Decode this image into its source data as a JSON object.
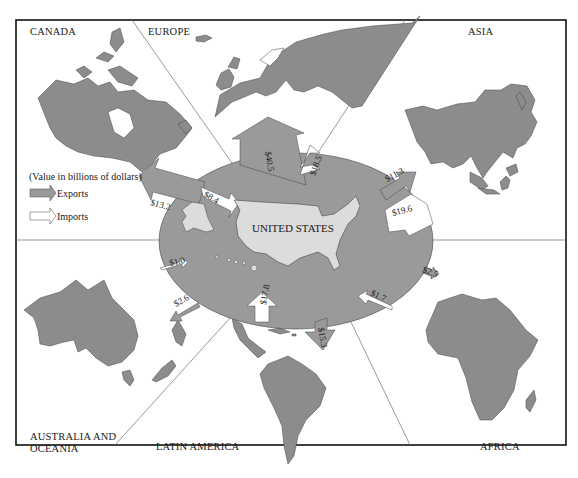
{
  "diagram": {
    "type": "trade-flow-map",
    "center_label": "UNITED STATES",
    "legend": {
      "note": "(Value in billions of dollars)",
      "exports_label": "Exports",
      "imports_label": "Imports"
    },
    "regions": [
      {
        "name": "CANADA",
        "exports": "$13.2",
        "imports": "$8.4"
      },
      {
        "name": "EUROPE",
        "exports": "$40.5",
        "imports": "$18.5"
      },
      {
        "name": "ASIA",
        "exports": "$11.3",
        "imports": "$19.6"
      },
      {
        "name": "AFRICA",
        "exports": "$2.5",
        "imports": "$1.7"
      },
      {
        "name": "LATIN AMERICA",
        "exports": "$15.3",
        "imports": "$17.8"
      },
      {
        "name": "AUSTRALIA AND OCEANIA",
        "name_line1": "AUSTRALIA AND",
        "name_line2": "OCEANIA",
        "exports": "$2.6",
        "imports": "$1.0"
      }
    ],
    "colors": {
      "land": "#8c8c8c",
      "ring": "#9a9a9a",
      "us_fill": "#dcdcdc",
      "import_arrow": "#ffffff",
      "frame": "#111111",
      "divider": "#6e6e6e"
    }
  }
}
